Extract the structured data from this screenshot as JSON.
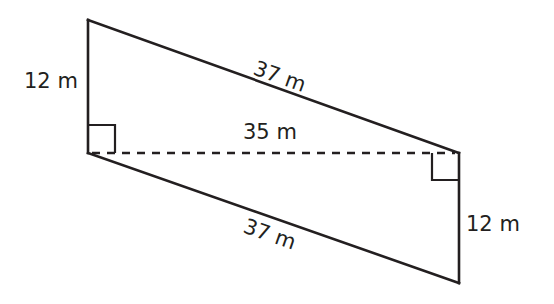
{
  "figure": {
    "shape": "parallelogram",
    "stroke_color": "#231f20",
    "background": "#ffffff",
    "labels": {
      "left_side": "12 m",
      "top_side": "37 m",
      "height_dashed": "35 m",
      "bottom_side": "37 m",
      "right_side": "12 m"
    },
    "right_angle_markers": [
      "left-bottom corner (between left side and dashed height)",
      "right-top corner (between dashed height and right side)"
    ]
  }
}
